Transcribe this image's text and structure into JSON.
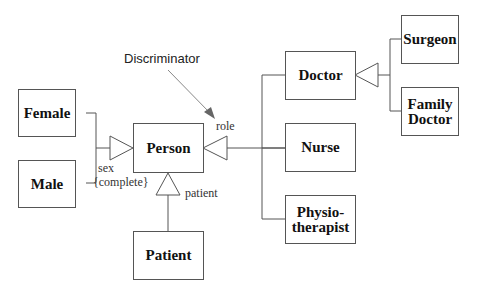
{
  "diagram": {
    "type": "UML class generalization diagram",
    "classes": {
      "female": "Female",
      "male": "Male",
      "person": "Person",
      "patient": "Patient",
      "doctor": "Doctor",
      "nurse": "Nurse",
      "physiotherapist": "Physio-\ntherapist",
      "surgeon": "Surgeon",
      "family_doctor": "Family\nDoctor"
    },
    "labels": {
      "discriminator": "Discriminator",
      "role": "role",
      "sex": "sex",
      "complete": "{complete}",
      "patient": "patient"
    },
    "generalizations": [
      {
        "parent": "Person",
        "children": [
          "Female",
          "Male"
        ],
        "discriminator": "sex",
        "constraint": "{complete}"
      },
      {
        "parent": "Person",
        "children": [
          "Doctor",
          "Nurse",
          "Physiotherapist"
        ],
        "discriminator": "role"
      },
      {
        "parent": "Person",
        "children": [
          "Patient"
        ],
        "discriminator": "patient"
      },
      {
        "parent": "Doctor",
        "children": [
          "Surgeon",
          "Family Doctor"
        ]
      }
    ],
    "colors": {
      "line": "#555555",
      "arrow": "#777777",
      "text": "#111111"
    }
  }
}
